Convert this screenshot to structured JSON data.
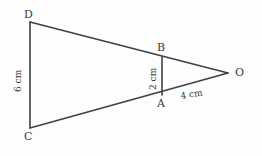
{
  "figure": {
    "kind": "geometry-diagram",
    "background_color": "#fdfdfd",
    "stroke_color": "#3f3f48",
    "text_color": "#3a3a42"
  },
  "points": {
    "D": {
      "label": "D",
      "x": 30,
      "y": 22
    },
    "C": {
      "label": "C",
      "x": 30,
      "y": 128
    },
    "B": {
      "label": "B",
      "x": 162,
      "y": 57
    },
    "A": {
      "label": "A",
      "x": 162,
      "y": 95
    },
    "O": {
      "label": "O",
      "x": 228,
      "y": 73
    }
  },
  "segments": [
    {
      "name": "CD",
      "from": "C",
      "to": "D",
      "orientation": "vertical"
    },
    {
      "name": "AB",
      "from": "A",
      "to": "B",
      "orientation": "vertical"
    },
    {
      "name": "DO",
      "from": "D",
      "to": "O",
      "orientation": "oblique",
      "passes_through": "B"
    },
    {
      "name": "CO",
      "from": "C",
      "to": "O",
      "orientation": "oblique",
      "passes_through": "A"
    }
  ],
  "measurements": {
    "cd": {
      "text": "6 cm",
      "segment": "CD",
      "rotated": true
    },
    "ab": {
      "text": "2 cm",
      "segment": "AB",
      "rotated": true
    },
    "ao": {
      "text": "4 cm",
      "segment": "AO",
      "rotated": true
    }
  }
}
